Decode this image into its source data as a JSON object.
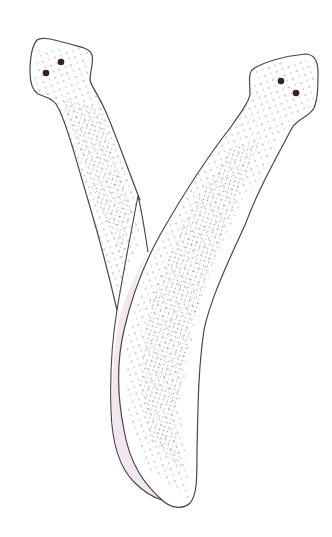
{
  "figure": {
    "description": "Y-shaped line-drawing illustration of two elongated stippled lobes crossing at the base",
    "colors": {
      "background": "#ffffff",
      "outline": "#4a4548",
      "stipple": "#7a7478",
      "overlap_fill": "#f4e6f0",
      "spot": "#3a1e24"
    },
    "left_lobe": {
      "spots": [
        {
          "cx": 46,
          "cy": 73
        },
        {
          "cx": 61,
          "cy": 62
        }
      ]
    },
    "right_lobe": {
      "spots": [
        {
          "cx": 281,
          "cy": 81
        },
        {
          "cx": 296,
          "cy": 93
        }
      ]
    }
  }
}
